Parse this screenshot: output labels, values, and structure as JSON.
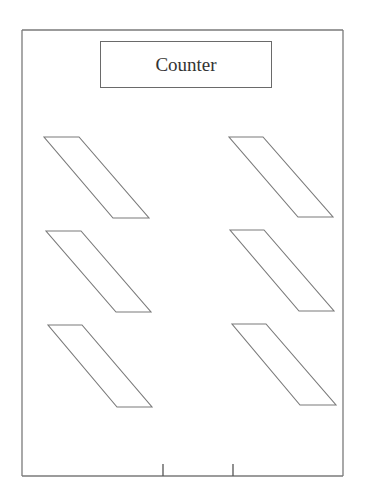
{
  "diagram": {
    "title": "Counter",
    "stroke_color": "#7a7a7a",
    "frame": {
      "x1": 22,
      "y1": 30,
      "x2": 343,
      "y2": 476
    },
    "ticks": [
      {
        "x": 163,
        "y1": 464,
        "y2": 476
      },
      {
        "x": 233,
        "y1": 464,
        "y2": 476
      }
    ],
    "parallelograms": [
      {
        "id": "left-top",
        "points": "44,137 79,137 149,218 113,218"
      },
      {
        "id": "right-top",
        "points": "229,137 263,137 333,217 298,217"
      },
      {
        "id": "left-middle",
        "points": "46,231 81,231 151,312 116,312"
      },
      {
        "id": "right-middle",
        "points": "230,230 264,230 334,311 299,311"
      },
      {
        "id": "left-bottom",
        "points": "48,325 82,325 152,407 117,407"
      },
      {
        "id": "right-bottom",
        "points": "232,324 266,324 336,405 300,405"
      }
    ]
  }
}
